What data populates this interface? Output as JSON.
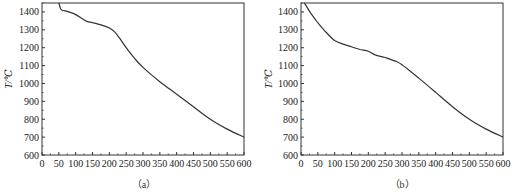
{
  "chart_data": [
    {
      "type": "line",
      "panel_label": "（a）",
      "title": "",
      "xlabel": "",
      "ylabel": "T/℃",
      "xlim": [
        0,
        600
      ],
      "ylim": [
        600,
        1450
      ],
      "xticks": [
        0,
        50,
        100,
        150,
        200,
        250,
        300,
        350,
        400,
        450,
        500,
        550,
        600
      ],
      "yticks": [
        600,
        700,
        800,
        900,
        1000,
        1100,
        1200,
        1300,
        1400
      ],
      "grid": false,
      "series": [
        {
          "name": "a",
          "x": [
            50,
            55,
            60,
            80,
            100,
            130,
            150,
            180,
            200,
            215,
            230,
            250,
            275,
            300,
            350,
            400,
            450,
            500,
            550,
            600
          ],
          "y": [
            1450,
            1420,
            1410,
            1400,
            1385,
            1350,
            1340,
            1325,
            1310,
            1290,
            1255,
            1200,
            1140,
            1090,
            1010,
            940,
            870,
            800,
            745,
            700
          ]
        }
      ]
    },
    {
      "type": "line",
      "panel_label": "（b）",
      "title": "",
      "xlabel": "",
      "ylabel": "T/℃",
      "xlim": [
        0,
        600
      ],
      "ylim": [
        600,
        1450
      ],
      "xticks": [
        0,
        50,
        100,
        150,
        200,
        250,
        300,
        350,
        400,
        450,
        500,
        550,
        600
      ],
      "yticks": [
        600,
        700,
        800,
        900,
        1000,
        1100,
        1200,
        1300,
        1400
      ],
      "grid": false,
      "series": [
        {
          "name": "b",
          "x": [
            10,
            30,
            50,
            75,
            100,
            125,
            150,
            175,
            200,
            220,
            250,
            280,
            300,
            350,
            400,
            450,
            500,
            550,
            600
          ],
          "y": [
            1450,
            1390,
            1340,
            1285,
            1240,
            1220,
            1205,
            1190,
            1180,
            1160,
            1145,
            1125,
            1105,
            1030,
            950,
            870,
            800,
            745,
            700
          ]
        }
      ]
    }
  ]
}
